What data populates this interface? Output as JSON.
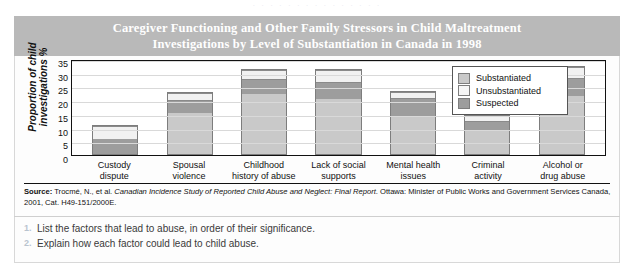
{
  "top_bleed": "· · · · · · · · · · · · · · ·",
  "figure": {
    "title": {
      "line1": "Caregiver Functioning and Other Family Stressors in Child Maltreatment",
      "line2": "Investigations by Level of Substantiation in Canada in 1998"
    },
    "source": {
      "label": "Source:",
      "text_before_italic": " Trocmé, N., et al. ",
      "italic": "Canadian Incidence Study of Reported Child Abuse and Neglect: Final Report",
      "text_after_italic": ". Ottawa: Minister of Public Works and Government Services Canada, 2001, Cat. H49-151/2000E."
    }
  },
  "questions": [
    {
      "number": "1.",
      "text": "List the factors that lead to abuse, in order of their significance."
    },
    {
      "number": "2.",
      "text": "Explain how each factor could lead to child abuse."
    }
  ],
  "chart_data": {
    "type": "bar",
    "stacked": true,
    "title": "Caregiver Functioning and Other Family Stressors in Child Maltreatment Investigations by Level of Substantiation in Canada in 1998",
    "xlabel": "",
    "ylabel": "Proportion of child investigations %",
    "ylim": [
      0,
      35
    ],
    "yticks": [
      0,
      5,
      10,
      15,
      20,
      25,
      30,
      35
    ],
    "grid": true,
    "legend_position": "top-right",
    "categories": [
      "Custody dispute",
      "Spousal violence",
      "Childhood history of abuse",
      "Lack of social supports",
      "Mental health issues",
      "Criminal activity",
      "Alcohol or drug abuse"
    ],
    "category_lines": [
      [
        "Custody",
        "dispute"
      ],
      [
        "Spousal",
        "violence"
      ],
      [
        "Childhood",
        "history of abuse"
      ],
      [
        "Lack of social",
        "supports"
      ],
      [
        "Mental health",
        "issues"
      ],
      [
        "Criminal",
        "activity"
      ],
      [
        "Alcohol or",
        "drug abuse"
      ]
    ],
    "series": [
      {
        "name": "Substantiated",
        "color": "#c9c9c9",
        "values": [
          0,
          15,
          22,
          20,
          14,
          8.5,
          21
        ]
      },
      {
        "name": "Suspected",
        "color": "#9d9d9d",
        "values": [
          5.5,
          4.5,
          5,
          6,
          6,
          3,
          6.5
        ]
      },
      {
        "name": "Unsubstantiated",
        "color": "#f1f1f1",
        "values": [
          4.5,
          2,
          3,
          4,
          2,
          1.5,
          3.5
        ]
      }
    ],
    "totals": [
      10,
      21.5,
      30,
      30,
      22,
      13,
      31
    ],
    "stack_order_bottom_to_top": [
      "Substantiated",
      "Suspected",
      "Unsubstantiated"
    ],
    "note_bar1_order_bottom_to_top": [
      "Suspected",
      "Unsubstantiated"
    ]
  }
}
